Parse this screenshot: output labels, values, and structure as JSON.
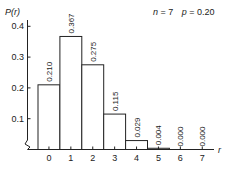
{
  "chart_data": {
    "type": "bar",
    "title": "",
    "annotation": "n = 7    p = 0.20",
    "annotation_parts": {
      "n_label": "n",
      "n_value": "= 7",
      "p_label": "p",
      "p_value": "= 0.20"
    },
    "xlabel": "r",
    "ylabel": "P(r)",
    "categories": [
      "0",
      "1",
      "2",
      "3",
      "4",
      "5",
      "6",
      "7"
    ],
    "values": [
      0.21,
      0.367,
      0.275,
      0.115,
      0.029,
      0.004,
      0.0,
      0.0
    ],
    "value_labels": [
      "0.210",
      "0.367",
      "0.275",
      "0.115",
      "0.029",
      "0.004",
      "0.000",
      "0.000"
    ],
    "yticks": [
      "0.1",
      "0.2",
      "0.3",
      "0.4"
    ],
    "ytick_values": [
      0.1,
      0.2,
      0.3,
      0.4
    ],
    "ylim": [
      0,
      0.4
    ],
    "grid": false,
    "legend": null,
    "axis_break": true
  },
  "colors": {
    "axis": "#222222",
    "bar_fill": "#ffffff",
    "bar_stroke": "#222222"
  }
}
